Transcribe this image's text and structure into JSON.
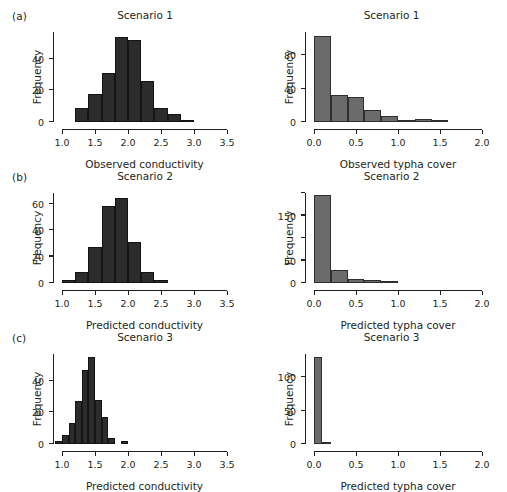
{
  "figure": {
    "panels": [
      {
        "letter": "(a)",
        "charts": [
          {
            "title": "Scenario 1",
            "xlabel": "Observed conductivity",
            "ylabel": "Frequency",
            "color": "#2c2c2c"
          },
          {
            "title": "Scenario 1",
            "xlabel": "Observed typha cover",
            "ylabel": "Frequency",
            "color": "#6b6b6b"
          }
        ]
      },
      {
        "letter": "(b)",
        "charts": [
          {
            "title": "Scenario 2",
            "xlabel": "Predicted conductivity",
            "ylabel": "Frequency",
            "color": "#2c2c2c"
          },
          {
            "title": "Scenario 2",
            "xlabel": "Predicted typha cover",
            "ylabel": "Frequency",
            "color": "#6b6b6b"
          }
        ]
      },
      {
        "letter": "(c)",
        "charts": [
          {
            "title": "Scenario 3",
            "xlabel": "Predicted conductivity",
            "ylabel": "Frequency",
            "color": "#2c2c2c"
          },
          {
            "title": "Scenario 3",
            "xlabel": "Predicted typha cover",
            "ylabel": "Frequency",
            "color": "#6b6b6b"
          }
        ]
      }
    ]
  },
  "chart_data": [
    {
      "id": "a-left",
      "type": "bar",
      "subtype": "histogram",
      "title": "Scenario 1",
      "panel": "(a)",
      "xlabel": "Observed conductivity",
      "ylabel": "Frequency",
      "xlim": [
        1.0,
        3.5
      ],
      "ylim": [
        0,
        57
      ],
      "xticks": [
        1.0,
        1.5,
        2.0,
        2.5,
        3.0,
        3.5
      ],
      "xticklabels": [
        "1.0",
        "1.5",
        "2.0",
        "2.5",
        "3.0",
        "3.5"
      ],
      "yticks": [
        0,
        20,
        40
      ],
      "yticklabels": [
        "0",
        "20",
        "40"
      ],
      "grid": false,
      "legend": false,
      "bin_width": 0.2,
      "bin_edges": [
        1.2,
        1.4,
        1.6,
        1.8,
        2.0,
        2.2,
        2.4,
        2.6,
        2.8,
        3.0
      ],
      "values": [
        9,
        18,
        31,
        54,
        52,
        26,
        9,
        5,
        1
      ],
      "color": "#2c2c2c"
    },
    {
      "id": "a-right",
      "type": "bar",
      "subtype": "histogram",
      "title": "Scenario 1",
      "panel": "(a)",
      "xlabel": "Observed typha cover",
      "ylabel": "Frequency",
      "xlim": [
        0.0,
        2.0
      ],
      "ylim": [
        0,
        108
      ],
      "xticks": [
        0.0,
        0.5,
        1.0,
        1.5,
        2.0
      ],
      "xticklabels": [
        "0.0",
        "0.5",
        "1.0",
        "1.5",
        "2.0"
      ],
      "yticks": [
        0,
        40,
        80
      ],
      "yticklabels": [
        "0",
        "40",
        "80"
      ],
      "grid": false,
      "legend": false,
      "bin_width": 0.2,
      "bin_edges": [
        0.0,
        0.2,
        0.4,
        0.6,
        0.8,
        1.0,
        1.2,
        1.4,
        1.6
      ],
      "values": [
        103,
        33,
        30,
        14,
        7,
        1,
        4,
        1
      ],
      "color": "#6b6b6b"
    },
    {
      "id": "b-left",
      "type": "bar",
      "subtype": "histogram",
      "title": "Scenario 2",
      "panel": "(b)",
      "xlabel": "Predicted conductivity",
      "ylabel": "Frequency",
      "xlim": [
        1.0,
        3.5
      ],
      "ylim": [
        0,
        68
      ],
      "xticks": [
        1.0,
        1.5,
        2.0,
        2.5,
        3.0,
        3.5
      ],
      "xticklabels": [
        "1.0",
        "1.5",
        "2.0",
        "2.5",
        "3.0",
        "3.5"
      ],
      "yticks": [
        0,
        20,
        40,
        60
      ],
      "yticklabels": [
        "0",
        "20",
        "40",
        "60"
      ],
      "grid": false,
      "legend": false,
      "bin_width": 0.2,
      "bin_edges": [
        1.0,
        1.2,
        1.4,
        1.6,
        1.8,
        2.0,
        2.2,
        2.4,
        2.6
      ],
      "values": [
        2,
        8,
        27,
        58,
        64,
        31,
        8,
        2
      ],
      "color": "#2c2c2c"
    },
    {
      "id": "b-right",
      "type": "bar",
      "subtype": "histogram",
      "title": "Scenario 2",
      "panel": "(b)",
      "xlabel": "Predicted typha cover",
      "ylabel": "Frequency",
      "xlim": [
        0.0,
        2.0
      ],
      "ylim": [
        0,
        200
      ],
      "xticks": [
        0.0,
        0.5,
        1.0,
        1.5,
        2.0
      ],
      "xticklabels": [
        "0.0",
        "0.5",
        "1.0",
        "1.5",
        "2.0"
      ],
      "yticks": [
        0,
        50,
        150
      ],
      "yticklabels": [
        "0",
        "50",
        "150"
      ],
      "grid": false,
      "legend": false,
      "bin_width": 0.2,
      "bin_edges": [
        0.0,
        0.2,
        0.4,
        0.6,
        0.8,
        1.0
      ],
      "values": [
        196,
        28,
        9,
        6,
        2
      ],
      "color": "#6b6b6b"
    },
    {
      "id": "c-left",
      "type": "bar",
      "subtype": "histogram",
      "title": "Scenario 3",
      "panel": "(c)",
      "xlabel": "Predicted conductivity",
      "ylabel": "Frequency",
      "xlim": [
        1.0,
        3.5
      ],
      "ylim": [
        0,
        57
      ],
      "xticks": [
        1.0,
        1.5,
        2.0,
        2.5,
        3.0,
        3.5
      ],
      "xticklabels": [
        "1.0",
        "1.5",
        "2.0",
        "2.5",
        "3.0",
        "3.5"
      ],
      "yticks": [
        0,
        20,
        40
      ],
      "yticklabels": [
        "0",
        "20",
        "40"
      ],
      "grid": false,
      "legend": false,
      "bin_width": 0.1,
      "bin_edges": [
        0.9,
        1.0,
        1.1,
        1.2,
        1.3,
        1.4,
        1.5,
        1.6,
        1.7,
        1.8,
        1.9,
        2.0
      ],
      "values": [
        2,
        6,
        13,
        27,
        47,
        55,
        28,
        17,
        4,
        0,
        2
      ],
      "color": "#2c2c2c"
    },
    {
      "id": "c-right",
      "type": "bar",
      "subtype": "histogram",
      "title": "Scenario 3",
      "panel": "(c)",
      "xlabel": "Predicted typha cover",
      "ylabel": "Frequency",
      "xlim": [
        0.0,
        2.0
      ],
      "ylim": [
        0,
        135
      ],
      "xticks": [
        0.0,
        0.5,
        1.0,
        1.5,
        2.0
      ],
      "xticklabels": [
        "0.0",
        "0.5",
        "1.0",
        "1.5",
        "2.0"
      ],
      "yticks": [
        0,
        50,
        100
      ],
      "yticklabels": [
        "0",
        "50",
        "100"
      ],
      "grid": false,
      "legend": false,
      "bin_width": 0.1,
      "bin_edges": [
        0.0,
        0.1,
        0.2
      ],
      "values": [
        130,
        2
      ],
      "color": "#6b6b6b"
    }
  ]
}
